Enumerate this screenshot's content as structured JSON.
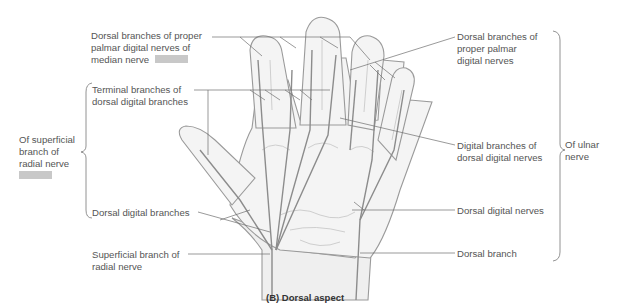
{
  "figure": {
    "caption": "(B) Dorsal aspect",
    "colors": {
      "outline": "#9a9a9a",
      "nerve": "#8c8c8c",
      "leader": "#6e6e6e",
      "text": "#555555",
      "placeholder": "#c8c8c8"
    }
  },
  "labels": {
    "median_dorsal_branches": "Dorsal branches of proper\npalmar digital nerves of\nmedian nerve",
    "terminal_branches": "Terminal branches of\ndorsal digital branches",
    "superficial_radial_group": "Of superficial\nbranch of\nradial nerve",
    "dorsal_digital_branches": "Dorsal digital branches",
    "superficial_branch_radial": "Superficial branch of\nradial nerve",
    "ulnar_dorsal_branches": "Dorsal branches of\nproper palmar\ndigital nerves",
    "digital_branches_dorsal": "Digital branches of\ndorsal digital nerves",
    "dorsal_digital_nerves": "Dorsal digital nerves",
    "dorsal_branch": "Dorsal branch",
    "ulnar_group": "Of ulnar\nnerve"
  },
  "placeholders": [
    {
      "name": "median-nerve-color-key"
    },
    {
      "name": "radial-nerve-color-key"
    }
  ]
}
